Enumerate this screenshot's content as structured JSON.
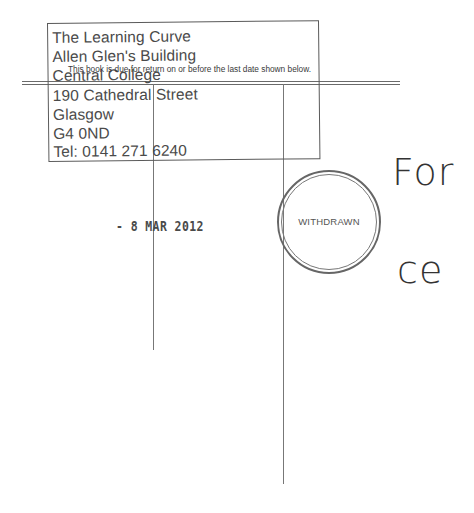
{
  "library_stamp": {
    "lines": [
      "The Learning Curve",
      "Allen Glen's Building",
      "Central College",
      "190 Cathedral Street",
      "Glasgow",
      "G4 0ND",
      "Tel: 0141 271 6240"
    ]
  },
  "due_notice": "This book is due for return on or before the last date shown below.",
  "date_stamp": "- 8 MAR 2012",
  "withdrawn_stamp": "WITHDRAWN",
  "background_text": {
    "fragment_1": "For",
    "fragment_2": "ce"
  }
}
